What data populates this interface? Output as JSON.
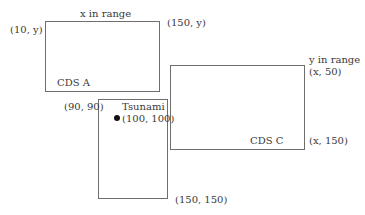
{
  "diagram": {
    "boxes": {
      "cds_a": {
        "name": "CDS A",
        "top_label": "x in range",
        "top_left_coord": "(10, y)",
        "top_right_coord": "(150, y)"
      },
      "cds_c": {
        "name": "CDS C",
        "top_label": "y in range",
        "top_right_coord": "(x, 50)",
        "bottom_right_coord": "(x, 150)"
      },
      "tsunami_region": {
        "top_left_coord": "(90, 90)",
        "bottom_right_coord": "(150, 150)"
      }
    },
    "point": {
      "name": "Tsunami",
      "coord": "(100, 100)"
    },
    "colors": {
      "line": "#6e6e6e",
      "text": "#3a3a3a",
      "dot": "#111111"
    }
  }
}
